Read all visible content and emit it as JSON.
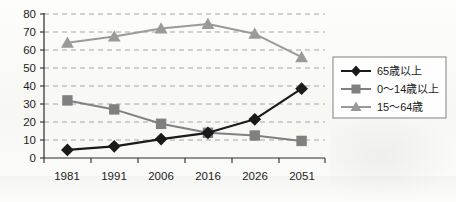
{
  "chart_data": {
    "type": "line",
    "title": "",
    "xlabel": "",
    "ylabel": "",
    "categories": [
      "1981",
      "1991",
      "2006",
      "2016",
      "2026",
      "2051"
    ],
    "ylim": [
      0,
      80
    ],
    "ytick_step": 10,
    "yticks": [
      "0",
      "10",
      "20",
      "30",
      "40",
      "50",
      "60",
      "70",
      "80"
    ],
    "grid": "horizontal-dashed",
    "legend_position": "right",
    "series": [
      {
        "name": "65歳以上",
        "marker": "diamond",
        "color": "#1a1a1a",
        "values": [
          4.5,
          6.5,
          10.5,
          14.0,
          21.5,
          38.5
        ]
      },
      {
        "name": "0〜14歳以上",
        "marker": "square",
        "color": "#808080",
        "values": [
          32.0,
          27.0,
          19.0,
          14.0,
          12.5,
          9.5
        ]
      },
      {
        "name": "15〜64歳",
        "marker": "triangle",
        "color": "#9a9a9a",
        "values": [
          64.0,
          67.5,
          72.0,
          74.5,
          69.0,
          56.0
        ]
      }
    ]
  },
  "axis": {
    "y_labels": [
      "80",
      "70",
      "60",
      "50",
      "40",
      "30",
      "20",
      "10",
      "0"
    ],
    "x_labels": [
      "1981",
      "1991",
      "2006",
      "2016",
      "2026",
      "2051"
    ]
  },
  "legend": {
    "items": [
      {
        "label": "65歳以上",
        "marker": "diamond",
        "color": "#1a1a1a"
      },
      {
        "label": "0〜14歳以上",
        "marker": "square",
        "color": "#808080"
      },
      {
        "label": "15〜64歳",
        "marker": "triangle",
        "color": "#9a9a9a"
      }
    ]
  },
  "colors": {
    "series_65plus": "#1a1a1a",
    "series_0_14": "#808080",
    "series_15_64": "#9a9a9a",
    "grid": "#9c9c9c",
    "axis": "#2a2a2a",
    "legend_border": "#8c8c8c",
    "background": "#fbfbf9"
  }
}
